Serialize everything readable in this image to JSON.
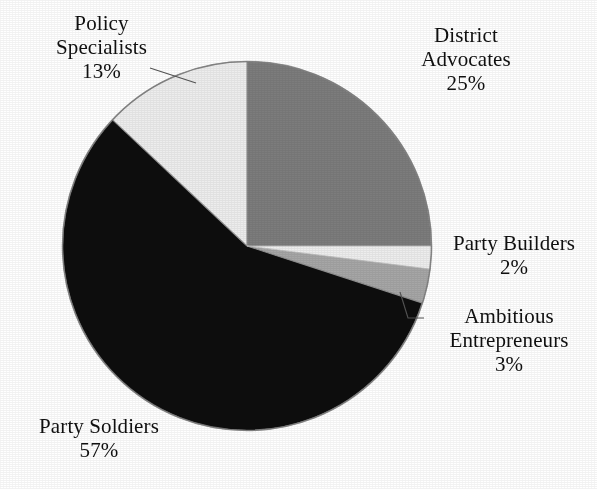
{
  "chart_data": {
    "type": "pie",
    "title": "",
    "subtitle": "",
    "xlabel": "",
    "ylabel": "",
    "legend_position": "none",
    "grid": false,
    "label_format": "name + percent",
    "start_angle_deg": 0,
    "direction": "clockwise",
    "categories": [
      "District Advocates",
      "Party Builders",
      "Ambitious Entrepreneurs",
      "Party Soldiers",
      "Policy Specialists"
    ],
    "values": [
      25,
      2,
      3,
      57,
      13
    ],
    "units": "percent",
    "total": 100,
    "slices": [
      {
        "name": "District Advocates",
        "label_line1": "District",
        "label_line2": "Advocates",
        "percent": 25,
        "percent_text": "25%",
        "color": "#7c7c7c",
        "start_deg": 0,
        "end_deg": 90,
        "has_leader_line": false
      },
      {
        "name": "Party Builders",
        "label_line1": "Party Builders",
        "label_line2": "",
        "percent": 2,
        "percent_text": "2%",
        "color": "#ededed",
        "start_deg": 90,
        "end_deg": 97.2,
        "has_leader_line": false
      },
      {
        "name": "Ambitious Entrepreneurs",
        "label_line1": "Ambitious",
        "label_line2": "Entrepreneurs",
        "percent": 3,
        "percent_text": "3%",
        "color": "#a6a6a6",
        "start_deg": 97.2,
        "end_deg": 108,
        "has_leader_line": true
      },
      {
        "name": "Party Soldiers",
        "label_line1": "Party Soldiers",
        "label_line2": "",
        "percent": 57,
        "percent_text": "57%",
        "color": "#0a0a0a",
        "start_deg": 108,
        "end_deg": 313.2,
        "has_leader_line": false
      },
      {
        "name": "Policy Specialists",
        "label_line1": "Policy",
        "label_line2": "Specialists",
        "percent": 13,
        "percent_text": "13%",
        "color": "#ededed",
        "start_deg": 313.2,
        "end_deg": 360,
        "has_leader_line": true
      }
    ]
  },
  "labels": {
    "policy_specialists": {
      "line1": "Policy",
      "line2": "Specialists",
      "percent": "13%"
    },
    "district_advocates": {
      "line1": "District",
      "line2": "Advocates",
      "percent": "25%"
    },
    "party_builders": {
      "line1": "Party Builders",
      "line2": "",
      "percent": "2%"
    },
    "ambitious_entrepreneurs": {
      "line1": "Ambitious",
      "line2": "Entrepreneurs",
      "percent": "3%"
    },
    "party_soldiers": {
      "line1": "Party Soldiers",
      "line2": "",
      "percent": "57%"
    }
  },
  "colors": {
    "background": "#ffffff",
    "text": "#101010",
    "slice_district_advocates": "#7c7c7c",
    "slice_party_builders": "#ededed",
    "slice_ambitious_entrepreneurs": "#a6a6a6",
    "slice_party_soldiers": "#0a0a0a",
    "slice_policy_specialists": "#ededed",
    "outline": "#8a8a8a",
    "leader_line": "#5a5a5a"
  }
}
